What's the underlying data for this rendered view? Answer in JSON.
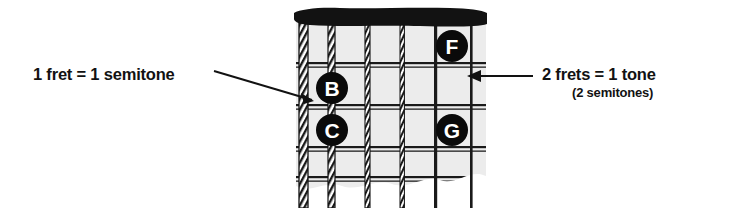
{
  "figure": {
    "board_color": "#ececec",
    "ink_color": "#121212",
    "marker_fill": "#0a0a0a",
    "marker_text_color": "#ffffff"
  },
  "annotations": {
    "left": {
      "text": "1 fret = 1 semitone",
      "arrow": "diagonal-arrow-down-right"
    },
    "right": {
      "line1": "2 frets = 1 tone",
      "line2": "(2 semitones)",
      "arrow": "horizontal-arrow-left"
    }
  },
  "fretboard": {
    "nut_label": "nut",
    "string_count": 6,
    "fret_count": 5,
    "strings": [
      {
        "index": 1,
        "name": "low-e-string",
        "wound": true
      },
      {
        "index": 2,
        "name": "a-string",
        "wound": true
      },
      {
        "index": 3,
        "name": "d-string",
        "wound": true
      },
      {
        "index": 4,
        "name": "g-string",
        "wound": true
      },
      {
        "index": 5,
        "name": "b-string",
        "wound": false
      },
      {
        "index": 6,
        "name": "high-e-string",
        "wound": false
      }
    ]
  },
  "markers": [
    {
      "id": "marker-f",
      "label": "F",
      "x": 452,
      "y": 46,
      "r": 16
    },
    {
      "id": "marker-b",
      "label": "B",
      "x": 332,
      "y": 88,
      "r": 16
    },
    {
      "id": "marker-c",
      "label": "C",
      "x": 332,
      "y": 130,
      "r": 16
    },
    {
      "id": "marker-g",
      "label": "G",
      "x": 452,
      "y": 130,
      "r": 16
    }
  ]
}
